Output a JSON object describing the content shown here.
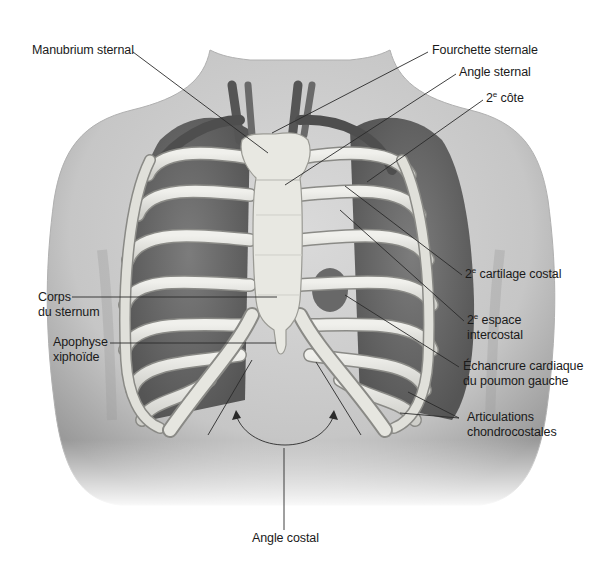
{
  "figure": {
    "type": "anatomical-illustration",
    "colors": {
      "background": "#ffffff",
      "skin": "#cfcfcf",
      "skin_shadow": "#9e9e9e",
      "bone": "#e6e6e0",
      "bone_edge": "#8a8a86",
      "lung": "#6e6e6e",
      "lung_dark": "#4a4a4a",
      "vessel": "#5a5a5a",
      "leader_line": "#2a2a2a",
      "text": "#1a1a1a"
    }
  },
  "labels": {
    "manubrium": {
      "text": "Manubrium sternal"
    },
    "fourchette": {
      "text": "Fourchette sternale"
    },
    "angle_sternal": {
      "text": "Angle sternal"
    },
    "cote2": {
      "prefix": "2",
      "sup": "e",
      "text": " côte"
    },
    "cartilage2": {
      "prefix": "2",
      "sup": "e",
      "text": " cartilage costal"
    },
    "espace2": {
      "prefix": "2",
      "sup": "e",
      "text": " espace",
      "line2": "intercostal"
    },
    "echancrure": {
      "line1": "Échancrure cardiaque",
      "line2": "du poumon gauche"
    },
    "articulations": {
      "line1": "Articulations",
      "line2": "chondrocostales"
    },
    "corps": {
      "line1": "Corps",
      "line2": "du sternum"
    },
    "xiphoide": {
      "line1": "Apophyse",
      "line2": "xiphoïde"
    },
    "angle_costal": {
      "text": "Angle costal"
    }
  }
}
